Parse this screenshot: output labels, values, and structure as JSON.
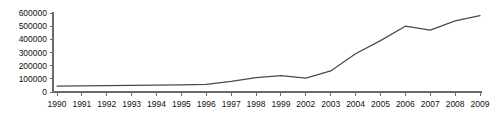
{
  "chart_data": {
    "type": "line",
    "title": "",
    "subtitle": "",
    "xlabel": "",
    "ylabel": "",
    "categories": [
      "1990",
      "1991",
      "1992",
      "1993",
      "1994",
      "1995",
      "1996",
      "1997",
      "1998",
      "1999",
      "2002",
      "2003",
      "2004",
      "2005",
      "2006",
      "2007",
      "2008",
      "2009"
    ],
    "values": [
      45000,
      47000,
      49000,
      50000,
      52000,
      54000,
      58000,
      80000,
      110000,
      125000,
      105000,
      160000,
      290000,
      390000,
      500000,
      470000,
      540000,
      580000
    ],
    "series": [
      {
        "name": "series-1",
        "values": [
          45000,
          47000,
          49000,
          50000,
          52000,
          54000,
          58000,
          80000,
          110000,
          125000,
          105000,
          160000,
          290000,
          390000,
          500000,
          470000,
          540000,
          580000
        ]
      }
    ],
    "xlim": [
      "1990",
      "2009"
    ],
    "ylim": [
      0,
      600000
    ],
    "yticks": [
      0,
      100000,
      200000,
      300000,
      400000,
      500000,
      600000
    ],
    "ytick_labels": [
      "0",
      "100000",
      "200000",
      "300000",
      "400000",
      "500000",
      "600000"
    ],
    "xtick_labels": [
      "1990",
      "1991",
      "1992",
      "1993",
      "1994",
      "1995",
      "1996",
      "1997",
      "1998",
      "1999",
      "2002",
      "2003",
      "2004",
      "2005",
      "2006",
      "2007",
      "2008",
      "2009"
    ],
    "grid": false,
    "legend": null,
    "legend_position": "none",
    "line_color": "#4a4a4a",
    "axis_color": "#6b6b6b",
    "background_color": "#ffffff",
    "annotations": []
  }
}
